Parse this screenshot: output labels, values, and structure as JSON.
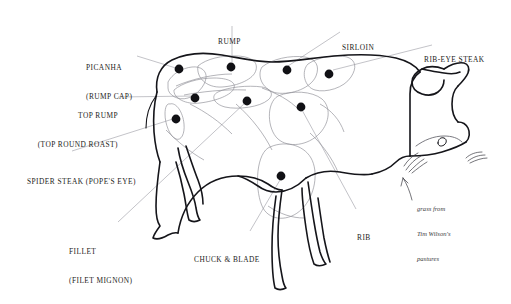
{
  "diagram": {
    "background_color": "#ffffff",
    "outline_color": "#15151a",
    "cut_line_color": "#8d8d95",
    "leader_line_color": "#9a9aa2",
    "dot_color": "#111115",
    "text_color": "#1d1d22"
  },
  "labels": {
    "picanha": {
      "line1": "PICANHA",
      "line2": "(RUMP CAP)"
    },
    "top_rump": {
      "line1": "TOP RUMP",
      "line2": "(TOP ROUND ROAST)"
    },
    "spider_steak": {
      "line1": "SPIDER STEAK (POPE'S EYE)"
    },
    "fillet": {
      "line1": "FILLET",
      "line2": "(FILET MIGNON)"
    },
    "chuck_and_blade": {
      "line1": "CHUCK & BLADE"
    },
    "rump": {
      "line1": "RUMP"
    },
    "sirloin": {
      "line1": "SIRLOIN"
    },
    "rib_eye_steak": {
      "line1": "RIB-EYE STEAK"
    },
    "rib": {
      "line1": "RIB"
    }
  },
  "note": {
    "line1": "grass from",
    "line2": "Tim Wilson's",
    "line3": "pastures"
  },
  "cut_markers": [
    {
      "name": "picanha",
      "x": 179,
      "y": 69
    },
    {
      "name": "rump",
      "x": 231,
      "y": 67
    },
    {
      "name": "sirloin",
      "x": 287,
      "y": 70
    },
    {
      "name": "rib-eye-steak",
      "x": 329,
      "y": 74
    },
    {
      "name": "top-rump",
      "x": 195,
      "y": 98
    },
    {
      "name": "fillet",
      "x": 247,
      "y": 101
    },
    {
      "name": "rib",
      "x": 301,
      "y": 107
    },
    {
      "name": "spider-steak",
      "x": 176,
      "y": 119
    },
    {
      "name": "chuck-and-blade",
      "x": 281,
      "y": 176
    }
  ]
}
